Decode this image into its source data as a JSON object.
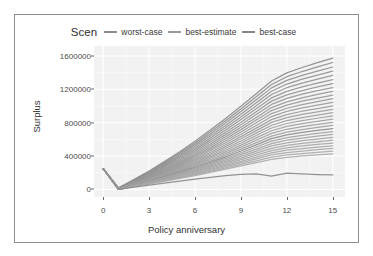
{
  "legend": {
    "title": "Scen",
    "items": [
      {
        "label": "worst-case",
        "color": "#8c8c8c"
      },
      {
        "label": "best-estimate",
        "color": "#9a9a9a"
      },
      {
        "label": "best-case",
        "color": "#878787"
      }
    ]
  },
  "chart_data": {
    "type": "line",
    "title": "",
    "xlabel": "Policy anniversary",
    "ylabel": "Surplus",
    "xlim": [
      -0.6,
      15.8
    ],
    "ylim": [
      -90000,
      1720000
    ],
    "grid": true,
    "legend_position": "top",
    "xticks": [
      0,
      3,
      6,
      9,
      12,
      15
    ],
    "xtick_labels": [
      "0",
      "3",
      "6",
      "9",
      "12",
      "15"
    ],
    "yticks": [
      0,
      400000,
      800000,
      1200000,
      1600000
    ],
    "ytick_labels": [
      "0",
      "400000",
      "800000",
      "1200000",
      "1600000"
    ],
    "x": [
      0,
      1,
      2,
      3,
      4,
      5,
      6,
      7,
      8,
      9,
      10,
      11,
      12,
      13,
      14,
      15
    ],
    "series": [
      {
        "name": "best-case",
        "color": "#8a8a8a",
        "values": [
          250000,
          20000,
          118000,
          222000,
          335000,
          452000,
          578000,
          712000,
          852000,
          998000,
          1148000,
          1300000,
          1398000,
          1462000,
          1520000,
          1575000
        ]
      },
      {
        "name": "scen-2",
        "color": "#8d8d8d",
        "values": [
          250000,
          18000,
          112000,
          212000,
          322000,
          436000,
          558000,
          688000,
          824000,
          966000,
          1112000,
          1258000,
          1352000,
          1414000,
          1470000,
          1522000
        ]
      },
      {
        "name": "scen-3",
        "color": "#8f8f8f",
        "values": [
          250000,
          16000,
          108000,
          204000,
          310000,
          420000,
          538000,
          664000,
          796000,
          934000,
          1076000,
          1218000,
          1308000,
          1368000,
          1420000,
          1468000
        ]
      },
      {
        "name": "scen-4",
        "color": "#909090",
        "values": [
          250000,
          15000,
          104000,
          196000,
          298000,
          404000,
          518000,
          640000,
          768000,
          902000,
          1040000,
          1178000,
          1264000,
          1322000,
          1372000,
          1418000
        ]
      },
      {
        "name": "scen-5",
        "color": "#929292",
        "values": [
          250000,
          14000,
          100000,
          188000,
          286000,
          388000,
          498000,
          616000,
          740000,
          870000,
          1004000,
          1138000,
          1220000,
          1276000,
          1324000,
          1368000
        ]
      },
      {
        "name": "scen-6",
        "color": "#939393",
        "values": [
          250000,
          13000,
          96000,
          180000,
          274000,
          372000,
          478000,
          592000,
          712000,
          838000,
          968000,
          1098000,
          1176000,
          1230000,
          1276000,
          1318000
        ]
      },
      {
        "name": "scen-7",
        "color": "#949494",
        "values": [
          250000,
          12000,
          92000,
          173000,
          263000,
          357000,
          459000,
          569000,
          685000,
          807000,
          933000,
          1059000,
          1134000,
          1186000,
          1230000,
          1270000
        ]
      },
      {
        "name": "scen-8",
        "color": "#959595",
        "values": [
          250000,
          11000,
          88000,
          166000,
          252000,
          342000,
          440000,
          546000,
          658000,
          776000,
          898000,
          1020000,
          1092000,
          1142000,
          1184000,
          1222000
        ]
      },
      {
        "name": "scen-9",
        "color": "#969696",
        "values": [
          250000,
          10000,
          85000,
          160000,
          242000,
          328000,
          422000,
          524000,
          632000,
          746000,
          864000,
          982000,
          1051000,
          1099000,
          1139000,
          1176000
        ]
      },
      {
        "name": "scen-10",
        "color": "#979797",
        "values": [
          250000,
          10000,
          82000,
          154000,
          233000,
          316000,
          406000,
          504000,
          608000,
          718000,
          832000,
          946000,
          1012000,
          1058000,
          1096000,
          1131000
        ]
      },
      {
        "name": "scen-11",
        "color": "#989898",
        "values": [
          250000,
          9000,
          79000,
          148000,
          224000,
          304000,
          390000,
          484000,
          584000,
          690000,
          800000,
          910000,
          974000,
          1018000,
          1054000,
          1088000
        ]
      },
      {
        "name": "scen-12",
        "color": "#999999",
        "values": [
          250000,
          8000,
          76000,
          142000,
          215000,
          292000,
          374000,
          464000,
          560000,
          662000,
          768000,
          874000,
          936000,
          978000,
          1012000,
          1044000
        ]
      },
      {
        "name": "scen-13",
        "color": "#9a9a9a",
        "values": [
          250000,
          8000,
          73000,
          136000,
          206000,
          280000,
          358000,
          444000,
          536000,
          634000,
          736000,
          838000,
          898000,
          938000,
          970000,
          1001000
        ]
      },
      {
        "name": "scen-14",
        "color": "#9b9b9b",
        "values": [
          250000,
          7000,
          70000,
          131000,
          198000,
          269000,
          344000,
          426000,
          514000,
          608000,
          706000,
          804000,
          862000,
          900000,
          931000,
          960000
        ]
      },
      {
        "name": "scen-15",
        "color": "#9c9c9c",
        "values": [
          250000,
          6000,
          67000,
          126000,
          190000,
          258000,
          330000,
          408000,
          492000,
          582000,
          676000,
          770000,
          826000,
          862000,
          892000,
          920000
        ]
      },
      {
        "name": "scen-16",
        "color": "#9d9d9d",
        "values": [
          250000,
          6000,
          64000,
          120000,
          182000,
          247000,
          316000,
          391000,
          471000,
          557000,
          647000,
          737000,
          791000,
          826000,
          854000,
          881000
        ]
      },
      {
        "name": "scen-17",
        "color": "#9e9e9e",
        "values": [
          250000,
          5000,
          62000,
          115000,
          174000,
          236000,
          302000,
          374000,
          450000,
          532000,
          618000,
          704000,
          756000,
          790000,
          817000,
          843000
        ]
      },
      {
        "name": "scen-18",
        "color": "#9f9f9f",
        "values": [
          250000,
          5000,
          59000,
          110000,
          167000,
          226000,
          289000,
          357000,
          430000,
          508000,
          590000,
          672000,
          722000,
          754000,
          780000,
          805000
        ]
      },
      {
        "name": "scen-19",
        "color": "#a0a0a0",
        "values": [
          250000,
          4000,
          57000,
          106000,
          160000,
          216000,
          276000,
          341000,
          410000,
          484000,
          562000,
          640000,
          688000,
          719000,
          744000,
          768000
        ]
      },
      {
        "name": "best-estimate",
        "color": "#8b8b8b",
        "values": [
          250000,
          4000,
          54000,
          101000,
          153000,
          207000,
          264000,
          326000,
          391000,
          461000,
          535000,
          609000,
          655000,
          684000,
          708000,
          731000
        ]
      },
      {
        "name": "scen-21",
        "color": "#a1a1a1",
        "values": [
          250000,
          3000,
          52000,
          97000,
          146000,
          197000,
          252000,
          311000,
          373000,
          439000,
          509000,
          579000,
          622000,
          650000,
          673000,
          695000
        ]
      },
      {
        "name": "scen-22",
        "color": "#a2a2a2",
        "values": [
          250000,
          3000,
          50000,
          93000,
          140000,
          189000,
          241000,
          296000,
          355000,
          418000,
          484000,
          550000,
          591000,
          617000,
          639000,
          660000
        ]
      },
      {
        "name": "scen-23",
        "color": "#a3a3a3",
        "values": [
          250000,
          2000,
          47000,
          88000,
          133000,
          180000,
          230000,
          282000,
          338000,
          397000,
          459000,
          522000,
          560000,
          585000,
          605000,
          625000
        ]
      },
      {
        "name": "scen-24",
        "color": "#a4a4a4",
        "values": [
          250000,
          2000,
          45000,
          84000,
          127000,
          171000,
          219000,
          269000,
          322000,
          377000,
          435000,
          494000,
          530000,
          553000,
          572000,
          591000
        ]
      },
      {
        "name": "scen-25",
        "color": "#a5a5a5",
        "values": [
          250000,
          2000,
          43000,
          80000,
          121000,
          163000,
          208000,
          255000,
          305000,
          357000,
          412000,
          467000,
          500000,
          522000,
          540000,
          557000
        ]
      },
      {
        "name": "scen-26",
        "color": "#a6a6a6",
        "values": [
          250000,
          1000,
          41000,
          76000,
          115000,
          155000,
          197000,
          242000,
          289000,
          338000,
          389000,
          440000,
          471000,
          491000,
          508000,
          524000
        ]
      },
      {
        "name": "scen-27",
        "color": "#a7a7a7",
        "values": [
          250000,
          1000,
          39000,
          73000,
          109000,
          147000,
          187000,
          229000,
          273000,
          319000,
          366000,
          414000,
          443000,
          461000,
          477000,
          492000
        ]
      },
      {
        "name": "scen-28",
        "color": "#a8a8a8",
        "values": [
          250000,
          1000,
          37000,
          69000,
          104000,
          139000,
          177000,
          216000,
          258000,
          300000,
          344000,
          388000,
          414000,
          431000,
          446000,
          460000
        ]
      },
      {
        "name": "scen-29",
        "color": "#a9a9a9",
        "values": [
          250000,
          0,
          35000,
          66000,
          98000,
          132000,
          167000,
          204000,
          243000,
          282000,
          322000,
          362000,
          386000,
          402000,
          415000,
          428000
        ]
      },
      {
        "name": "worst-case",
        "color": "#888888",
        "values": [
          250000,
          0,
          28000,
          52000,
          76000,
          100000,
          124000,
          146000,
          166000,
          180000,
          186000,
          160000,
          196000,
          186000,
          178000,
          174000
        ]
      }
    ],
    "annotations": [
      "dense fan of ~30 gray scenario paths diverging from a common dip at anniversary 1",
      "all paths start near 250000 at anniversary 0 and drop to near 0 at anniversary 1",
      "lowest path (worst-case) stays flat near 170000 after anniversary 9 with a dip-and-rebound wiggle around 11-12",
      "highest path (best-case) reaches about 1575000 at anniversary 15"
    ]
  }
}
